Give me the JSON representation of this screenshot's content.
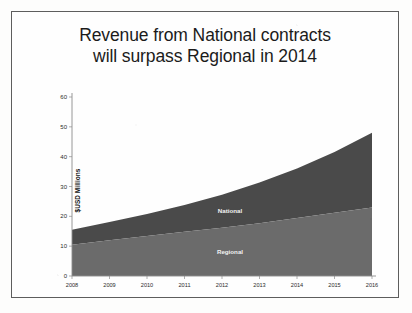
{
  "slide": {
    "title_line_1": "Revenue from National contracts",
    "title_line_2": "will surpass Regional in 2014"
  },
  "colors": {
    "national_fill": "#4a4a4a",
    "regional_fill": "#6b6b6b",
    "axis": "#8d8d8d",
    "text": "#1b1b1b",
    "frame": "#5d5d5d",
    "series_label_text": "#f2f2f2"
  },
  "chart_data": {
    "type": "area",
    "stacked": true,
    "title": "Revenue from National contracts will surpass Regional in 2014",
    "xlabel": "",
    "ylabel": "$USD Millions",
    "categories": [
      "2008",
      "2009",
      "2010",
      "2011",
      "2012",
      "2013",
      "2014",
      "2015",
      "2016"
    ],
    "x": [
      2008,
      2009,
      2010,
      2011,
      2012,
      2013,
      2014,
      2015,
      2016
    ],
    "series": [
      {
        "name": "Regional",
        "values": [
          10.5,
          12.0,
          13.4,
          14.8,
          16.2,
          17.7,
          19.4,
          21.2,
          23.0
        ]
      },
      {
        "name": "National",
        "values": [
          5.0,
          6.1,
          7.4,
          9.0,
          11.0,
          13.6,
          16.6,
          20.4,
          25.0
        ]
      }
    ],
    "totals": [
      15.5,
      18.1,
      20.8,
      23.8,
      27.2,
      31.3,
      36.0,
      41.6,
      48.0
    ],
    "ylim": [
      0,
      60
    ],
    "yticks": [
      0,
      10,
      20,
      30,
      40,
      50,
      60
    ],
    "ytick_labels": [
      "0",
      "10",
      "20",
      "30",
      "40",
      "50",
      "60"
    ],
    "grid": false,
    "legend": "inline-labels",
    "annotations": [
      {
        "text": "National",
        "series": "National"
      },
      {
        "text": "Regional",
        "series": "Regional"
      }
    ]
  }
}
